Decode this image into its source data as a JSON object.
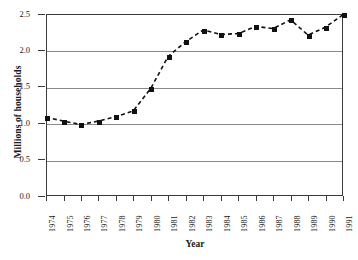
{
  "chart_data": {
    "type": "line",
    "title": "",
    "subtitle": "",
    "xlabel": "Year",
    "ylabel": "Millions of households",
    "categories": [
      "1974",
      "1975",
      "1976",
      "1977",
      "1978",
      "1979",
      "1980",
      "1981",
      "1982",
      "1983",
      "1984",
      "1985",
      "1986",
      "1987",
      "1988",
      "1989",
      "1990",
      "1991"
    ],
    "values": [
      1.08,
      1.03,
      0.98,
      1.03,
      1.09,
      1.17,
      1.48,
      1.92,
      2.12,
      2.28,
      2.22,
      2.23,
      2.33,
      2.3,
      2.42,
      2.21,
      2.32,
      2.49
    ],
    "series": [
      {
        "name": "Millions of households",
        "values": [
          1.08,
          1.03,
          0.98,
          1.03,
          1.09,
          1.17,
          1.48,
          1.92,
          2.12,
          2.28,
          2.22,
          2.23,
          2.33,
          2.3,
          2.42,
          2.21,
          2.32,
          2.49
        ]
      }
    ],
    "ylim": [
      0.0,
      2.5
    ],
    "yticks": [
      "0.0",
      "0.5",
      "1.0",
      "1.5",
      "2.0",
      "2.5"
    ],
    "ytick_values": [
      0.0,
      0.5,
      1.0,
      1.5,
      2.0,
      2.5
    ],
    "xticks": [
      "1974",
      "1975",
      "1976",
      "1977",
      "1978",
      "1979",
      "1980",
      "1981",
      "1982",
      "1983",
      "1984",
      "1985",
      "1986",
      "1987",
      "1988",
      "1989",
      "1990",
      "1991"
    ],
    "grid": true,
    "grid_axis": "y",
    "legend": false,
    "legend_position": "none",
    "line_style": "dashed",
    "marker_style": "square",
    "marker_color": "#111111",
    "line_color": "#111111",
    "grid_color": "#8a8a8a",
    "frame_color": "#3a3a3a",
    "background": "#ffffff",
    "annotations": []
  }
}
